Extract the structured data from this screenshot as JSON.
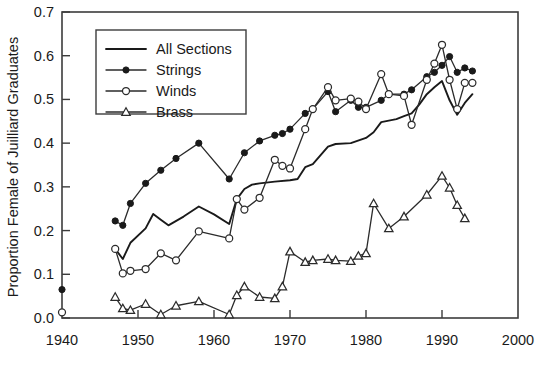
{
  "chart_data": {
    "type": "line",
    "title": "",
    "xlabel": "",
    "ylabel": "Proportion Female of Juilliard Graduates",
    "xlim": [
      1940,
      2000
    ],
    "ylim": [
      0.0,
      0.7
    ],
    "grid": false,
    "legend_position": "upper-left-inside",
    "x_ticks": [
      1940,
      1950,
      1960,
      1970,
      1980,
      1990,
      2000
    ],
    "x_tick_labels": [
      "1940",
      "1950",
      "1960",
      "1970",
      "1980",
      "1990",
      "2000"
    ],
    "y_ticks": [
      0.0,
      0.1,
      0.2,
      0.3,
      0.4,
      0.5,
      0.6,
      0.7
    ],
    "y_tick_labels": [
      "0.0",
      "0.1",
      "0.2",
      "0.3",
      "0.4",
      "0.5",
      "0.6",
      "0.7"
    ],
    "series": [
      {
        "name": "All Sections",
        "marker": "none",
        "style": "thick-line",
        "points": [
          [
            1947,
            0.158
          ],
          [
            1948,
            0.135
          ],
          [
            1949,
            0.172
          ],
          [
            1951,
            0.205
          ],
          [
            1952,
            0.238
          ],
          [
            1953,
            0.225
          ],
          [
            1954,
            0.212
          ],
          [
            1956,
            0.232
          ],
          [
            1958,
            0.255
          ],
          [
            1960,
            0.237
          ],
          [
            1962,
            0.215
          ],
          [
            1963,
            0.272
          ],
          [
            1964,
            0.295
          ],
          [
            1965,
            0.305
          ],
          [
            1966,
            0.308
          ],
          [
            1968,
            0.312
          ],
          [
            1970,
            0.315
          ],
          [
            1971,
            0.318
          ],
          [
            1972,
            0.345
          ],
          [
            1973,
            0.352
          ],
          [
            1975,
            0.392
          ],
          [
            1976,
            0.398
          ],
          [
            1978,
            0.4
          ],
          [
            1980,
            0.412
          ],
          [
            1981,
            0.425
          ],
          [
            1982,
            0.448
          ],
          [
            1984,
            0.455
          ],
          [
            1985,
            0.462
          ],
          [
            1986,
            0.468
          ],
          [
            1987,
            0.488
          ],
          [
            1988,
            0.512
          ],
          [
            1989,
            0.528
          ],
          [
            1990,
            0.542
          ],
          [
            1991,
            0.498
          ],
          [
            1992,
            0.465
          ],
          [
            1993,
            0.492
          ],
          [
            1994,
            0.512
          ]
        ]
      },
      {
        "name": "Strings",
        "marker": "filled-circle",
        "style": "line-marker",
        "points": [
          [
            1940,
            0.065
          ],
          [
            1947,
            0.222
          ],
          [
            1948,
            0.212
          ],
          [
            1949,
            0.262
          ],
          [
            1951,
            0.308
          ],
          [
            1953,
            0.338
          ],
          [
            1955,
            0.365
          ],
          [
            1958,
            0.4
          ],
          [
            1962,
            0.318
          ],
          [
            1964,
            0.378
          ],
          [
            1966,
            0.405
          ],
          [
            1968,
            0.418
          ],
          [
            1969,
            0.422
          ],
          [
            1970,
            0.432
          ],
          [
            1972,
            0.468
          ],
          [
            1973,
            0.478
          ],
          [
            1975,
            0.518
          ],
          [
            1976,
            0.472
          ],
          [
            1978,
            0.498
          ],
          [
            1979,
            0.482
          ],
          [
            1980,
            0.482
          ],
          [
            1982,
            0.498
          ],
          [
            1983,
            0.512
          ],
          [
            1985,
            0.512
          ],
          [
            1986,
            0.522
          ],
          [
            1988,
            0.552
          ],
          [
            1989,
            0.562
          ],
          [
            1990,
            0.578
          ],
          [
            1991,
            0.598
          ],
          [
            1992,
            0.562
          ],
          [
            1993,
            0.572
          ],
          [
            1994,
            0.565
          ]
        ]
      },
      {
        "name": "Winds",
        "marker": "open-circle",
        "style": "line-marker",
        "points": [
          [
            1940,
            0.013
          ],
          [
            1947,
            0.158
          ],
          [
            1948,
            0.102
          ],
          [
            1949,
            0.108
          ],
          [
            1951,
            0.112
          ],
          [
            1953,
            0.148
          ],
          [
            1955,
            0.132
          ],
          [
            1958,
            0.198
          ],
          [
            1962,
            0.182
          ],
          [
            1963,
            0.272
          ],
          [
            1964,
            0.248
          ],
          [
            1966,
            0.275
          ],
          [
            1968,
            0.362
          ],
          [
            1969,
            0.348
          ],
          [
            1970,
            0.342
          ],
          [
            1972,
            0.432
          ],
          [
            1973,
            0.478
          ],
          [
            1975,
            0.528
          ],
          [
            1976,
            0.498
          ],
          [
            1978,
            0.502
          ],
          [
            1979,
            0.495
          ],
          [
            1980,
            0.478
          ],
          [
            1982,
            0.558
          ],
          [
            1983,
            0.512
          ],
          [
            1985,
            0.508
          ],
          [
            1986,
            0.442
          ],
          [
            1988,
            0.545
          ],
          [
            1989,
            0.582
          ],
          [
            1990,
            0.625
          ],
          [
            1991,
            0.545
          ],
          [
            1992,
            0.478
          ],
          [
            1993,
            0.538
          ],
          [
            1994,
            0.538
          ]
        ]
      },
      {
        "name": "Brass",
        "marker": "open-triangle",
        "style": "line-marker",
        "points": [
          [
            1947,
            0.048
          ],
          [
            1948,
            0.022
          ],
          [
            1949,
            0.018
          ],
          [
            1951,
            0.032
          ],
          [
            1953,
            0.008
          ],
          [
            1955,
            0.028
          ],
          [
            1958,
            0.038
          ],
          [
            1962,
            0.008
          ],
          [
            1963,
            0.052
          ],
          [
            1964,
            0.072
          ],
          [
            1966,
            0.048
          ],
          [
            1968,
            0.045
          ],
          [
            1969,
            0.072
          ],
          [
            1970,
            0.152
          ],
          [
            1972,
            0.128
          ],
          [
            1973,
            0.132
          ],
          [
            1975,
            0.135
          ],
          [
            1976,
            0.132
          ],
          [
            1978,
            0.13
          ],
          [
            1979,
            0.142
          ],
          [
            1980,
            0.148
          ],
          [
            1981,
            0.262
          ],
          [
            1983,
            0.205
          ],
          [
            1985,
            0.232
          ],
          [
            1988,
            0.282
          ],
          [
            1990,
            0.325
          ],
          [
            1991,
            0.298
          ],
          [
            1992,
            0.258
          ],
          [
            1993,
            0.228
          ]
        ]
      }
    ],
    "legend_entries": [
      {
        "label": "All Sections",
        "marker": "none"
      },
      {
        "label": "Strings",
        "marker": "filled-circle"
      },
      {
        "label": "Winds",
        "marker": "open-circle"
      },
      {
        "label": "Brass",
        "marker": "open-triangle"
      }
    ]
  }
}
